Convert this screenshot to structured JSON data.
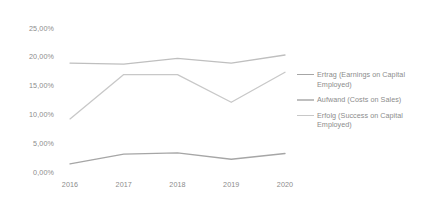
{
  "chart_data": {
    "type": "line",
    "title": "",
    "xlabel": "",
    "ylabel": "",
    "categories": [
      "2016",
      "2017",
      "2018",
      "2019",
      "2020"
    ],
    "ylim": [
      0,
      25
    ],
    "ytick_labels": [
      "0,00%",
      "5,00%",
      "10,00%",
      "15,00%",
      "20,00%",
      "25,00%"
    ],
    "ytick_values": [
      0,
      5,
      10,
      15,
      20,
      25
    ],
    "grid": false,
    "legend_position": "right",
    "value_format": "percent-comma-decimal",
    "series": [
      {
        "name": "Ertrag (Earnings on Capital Employed)",
        "color": "#a6a6a6",
        "values": [
          1.5,
          3.2,
          3.4,
          2.3,
          3.3
        ]
      },
      {
        "name": "Aufwand (Costs on Sales)",
        "color": "#bfbfbf",
        "values": [
          19.0,
          18.8,
          19.8,
          19.0,
          20.4
        ]
      },
      {
        "name": "Erfolg (Success on Capital Employed)",
        "color": "#c8c8c8",
        "values": [
          9.3,
          17.0,
          17.0,
          12.2,
          17.4
        ]
      }
    ]
  },
  "legend": {
    "items": [
      {
        "label": "Ertrag (Earnings on Capital Employed)",
        "color": "#a6a6a6"
      },
      {
        "label": "Aufwand (Costs on Sales)",
        "color": "#bfbfbf"
      },
      {
        "label": "Erfolg (Success on Capital Employed)",
        "color": "#c8c8c8"
      }
    ]
  },
  "colors": {
    "background": "#ffffff",
    "tick_text": "#8c8c8c"
  }
}
